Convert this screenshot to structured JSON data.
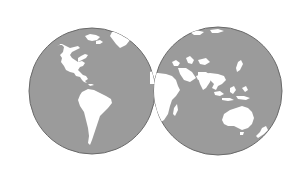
{
  "map": {
    "type": "two-hemisphere world map",
    "colors": {
      "background": "#ffffff",
      "ocean": "#9b9b9b",
      "outline": "#6a6a6a",
      "land": "#ffffff"
    },
    "hemispheres": [
      {
        "name": "western",
        "cx": 92,
        "cy": 91,
        "r": 63
      },
      {
        "name": "eastern",
        "cx": 218,
        "cy": 91,
        "r": 64
      }
    ],
    "landmasses": [
      "north-america",
      "greenland",
      "south-america",
      "europe",
      "africa",
      "madagascar",
      "asia",
      "arabia",
      "india",
      "southeast-asia",
      "japan",
      "australia",
      "new-zealand",
      "indonesia"
    ]
  }
}
